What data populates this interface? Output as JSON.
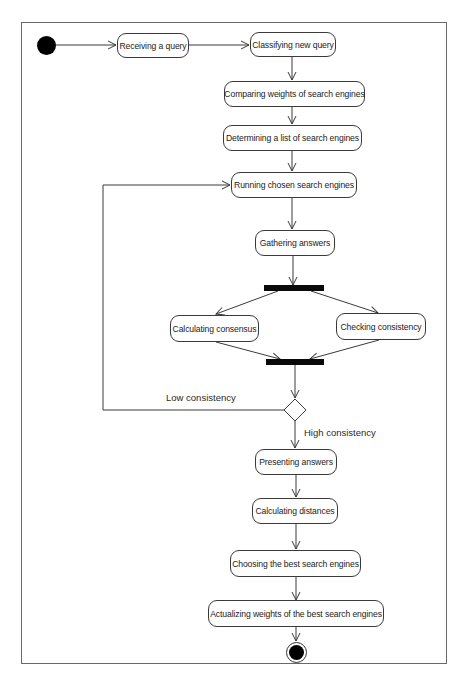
{
  "diagram": {
    "type": "UML activity diagram",
    "title": "",
    "start_node": {
      "kind": "initial"
    },
    "end_node": {
      "kind": "final"
    },
    "activities": [
      {
        "id": "receiving",
        "label": "Receiving a query"
      },
      {
        "id": "classifying",
        "label": "Classifying new query"
      },
      {
        "id": "comparing",
        "label": "Comparing weights of search engines"
      },
      {
        "id": "determining",
        "label": "Determining a list of search engines"
      },
      {
        "id": "running",
        "label": "Running chosen search engines"
      },
      {
        "id": "gathering",
        "label": "Gathering answers"
      },
      {
        "id": "consensus",
        "label": "Calculating consensus"
      },
      {
        "id": "checking",
        "label": "Checking consistency"
      },
      {
        "id": "presenting",
        "label": "Presenting answers"
      },
      {
        "id": "distances",
        "label": "Calculating distances"
      },
      {
        "id": "choosing",
        "label": "Choosing the best search engines"
      },
      {
        "id": "actualizing",
        "label": "Actualizing weights  of the best search engines"
      }
    ],
    "guards": {
      "low": "Low consistency",
      "high": "High consistency"
    },
    "edges": [
      [
        "start",
        "receiving"
      ],
      [
        "receiving",
        "classifying"
      ],
      [
        "classifying",
        "comparing"
      ],
      [
        "comparing",
        "determining"
      ],
      [
        "determining",
        "running"
      ],
      [
        "running",
        "gathering"
      ],
      [
        "gathering",
        "fork"
      ],
      [
        "fork",
        "consensus"
      ],
      [
        "fork",
        "checking"
      ],
      [
        "consensus",
        "join"
      ],
      [
        "checking",
        "join"
      ],
      [
        "join",
        "decision"
      ],
      [
        "decision",
        "running",
        "Low consistency"
      ],
      [
        "decision",
        "presenting",
        "High consistency"
      ],
      [
        "presenting",
        "distances"
      ],
      [
        "distances",
        "choosing"
      ],
      [
        "choosing",
        "actualizing"
      ],
      [
        "actualizing",
        "end"
      ]
    ],
    "colors": {
      "line": "#3a3a3a",
      "bar": "#0a0a0a",
      "frame": "#6a6a6a"
    }
  }
}
